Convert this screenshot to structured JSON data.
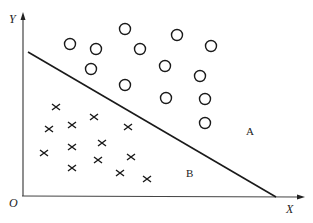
{
  "diagram": {
    "type": "linear-classifier-scatter",
    "axes": {
      "x_label": "X",
      "y_label": "Y",
      "origin_label": "O",
      "color": "#333333"
    },
    "decision_boundary": {
      "from": [
        28,
        52
      ],
      "to": [
        276,
        197
      ],
      "color": "#1a1a1a"
    },
    "regions": [
      {
        "label": "A",
        "x": 250,
        "y": 135
      },
      {
        "label": "B",
        "x": 190,
        "y": 177
      }
    ],
    "class_A_marker": "circle",
    "class_B_marker": "cross",
    "circles": [
      [
        70,
        44
      ],
      [
        96,
        49
      ],
      [
        125,
        29
      ],
      [
        140,
        49
      ],
      [
        177,
        35
      ],
      [
        211,
        46
      ],
      [
        91,
        69
      ],
      [
        165,
        66
      ],
      [
        200,
        76
      ],
      [
        125,
        85
      ],
      [
        166,
        98
      ],
      [
        205,
        99
      ],
      [
        205,
        123
      ]
    ],
    "crosses": [
      [
        56,
        107
      ],
      [
        49,
        129
      ],
      [
        72,
        125
      ],
      [
        94,
        117
      ],
      [
        128,
        127
      ],
      [
        44,
        153
      ],
      [
        72,
        147
      ],
      [
        102,
        143
      ],
      [
        72,
        168
      ],
      [
        98,
        160
      ],
      [
        131,
        157
      ],
      [
        120,
        173
      ],
      [
        147,
        179
      ]
    ]
  }
}
